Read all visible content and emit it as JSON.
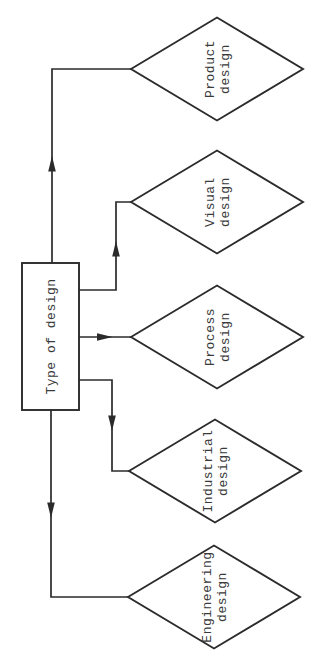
{
  "flowchart": {
    "root": {
      "label": "Type of design"
    },
    "branches": [
      {
        "line1": "Product",
        "line2": "design"
      },
      {
        "line1": "Visual",
        "line2": "design"
      },
      {
        "line1": "Process",
        "line2": "design"
      },
      {
        "line1": "Industrial",
        "line2": "design"
      },
      {
        "line1": "Engineering",
        "line2": "design"
      }
    ],
    "colors": {
      "line": "#2b2b2b",
      "text": "#3a3a3a",
      "background": "#ffffff"
    }
  }
}
